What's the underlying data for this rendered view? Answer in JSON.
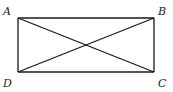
{
  "figure": {
    "title": "",
    "shape": "rectangle with diagonals",
    "vertices": [
      {
        "label": "A",
        "x": 18,
        "y": 18,
        "lx": 3,
        "ly": 15
      },
      {
        "label": "B",
        "x": 154,
        "y": 18,
        "lx": 158,
        "ly": 15
      },
      {
        "label": "C",
        "x": 154,
        "y": 72,
        "lx": 158,
        "ly": 87
      },
      {
        "label": "D",
        "x": 18,
        "y": 72,
        "lx": 3,
        "ly": 87
      }
    ],
    "segments": [
      [
        "A",
        "B"
      ],
      [
        "B",
        "C"
      ],
      [
        "C",
        "D"
      ],
      [
        "D",
        "A"
      ],
      [
        "A",
        "C"
      ],
      [
        "B",
        "D"
      ]
    ],
    "stroke_color": "#1a1a1a"
  }
}
